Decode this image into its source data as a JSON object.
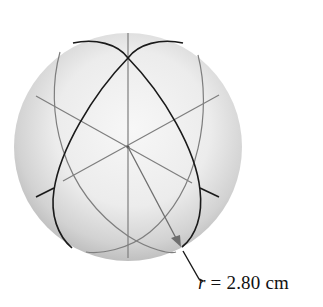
{
  "figure": {
    "annotation": {
      "variable": "r",
      "equals": " = ",
      "value": "2.80",
      "unit": " cm"
    },
    "colors": {
      "sphere_fill_light": "#f4f4f4",
      "sphere_fill_dark": "#a8a8a8",
      "front_ellipse": "#1a1a1a",
      "back_lines": "#7a7a7a",
      "text": "#111111"
    }
  }
}
